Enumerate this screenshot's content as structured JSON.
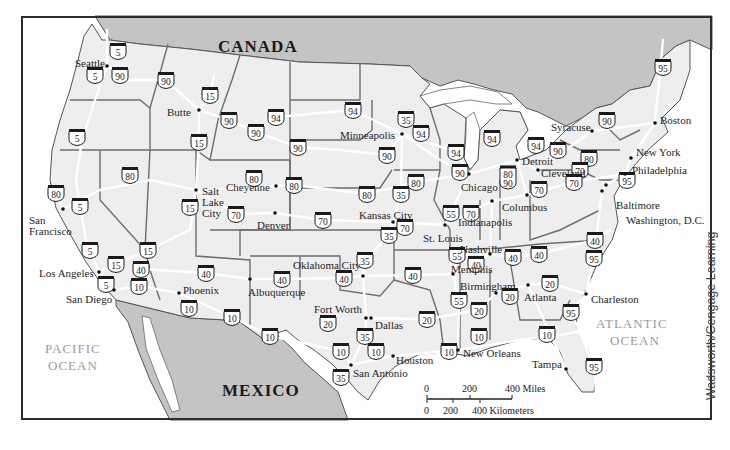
{
  "map": {
    "credit": "Wadsworth/Cengage Learning",
    "colors": {
      "land_us": "#eeeeee",
      "land_foreign": "#c4c4c4",
      "water": "#ffffff",
      "roads": "#ffffff",
      "state_borders": "#6e6e6e",
      "country_border": "#4a4a4a",
      "frame": "#2b2b2b"
    },
    "countries": [
      {
        "name": "CANADA",
        "x": 218,
        "y": 52
      },
      {
        "name": "MEXICO",
        "x": 222,
        "y": 396
      }
    ],
    "oceans": [
      {
        "name": "PACIFIC",
        "line2": "OCEAN",
        "x": 78,
        "y": 350
      },
      {
        "name": "ATLANTIC",
        "line2": "OCEAN",
        "x": 644,
        "y": 330
      }
    ],
    "cities": [
      {
        "name": "Seattle",
        "x": 107,
        "y": 66,
        "dx": -32,
        "dy": -2
      },
      {
        "name": "Butte",
        "x": 199,
        "y": 110,
        "dx": -32,
        "dy": 3
      },
      {
        "name": "Minneapolis",
        "x": 402,
        "y": 134,
        "dx": -62,
        "dy": 2
      },
      {
        "name": "Syracuse",
        "x": 592,
        "y": 131,
        "dx": -41,
        "dy": -3
      },
      {
        "name": "Boston",
        "x": 655,
        "y": 123,
        "dx": 5,
        "dy": -2
      },
      {
        "name": "Detroit",
        "x": 517,
        "y": 160,
        "dx": 5,
        "dy": 2
      },
      {
        "name": "New York",
        "x": 631,
        "y": 158,
        "dx": 5,
        "dy": -5
      },
      {
        "name": "Philadelphia",
        "x": 625,
        "y": 174,
        "dx": 7,
        "dy": -3
      },
      {
        "name": "Cleveland",
        "x": 538,
        "y": 170,
        "dx": 3,
        "dy": 4
      },
      {
        "name": "Chicago",
        "x": 469,
        "y": 174,
        "dx": -8,
        "dy": 14
      },
      {
        "name": "Baltimore",
        "x": 606,
        "y": 185,
        "dx": 10,
        "dy": 21
      },
      {
        "name": "Washington, D.C.",
        "x": 602,
        "y": 191,
        "dx": 24,
        "dy": 30
      },
      {
        "name": "Columbus",
        "x": 527,
        "y": 195,
        "dx": -25,
        "dy": 13
      },
      {
        "name": "Indianapolis",
        "x": 492,
        "y": 201,
        "dx": -34,
        "dy": 22
      },
      {
        "name": "Salt Lake City",
        "x": 196,
        "y": 190,
        "dx": 6,
        "dy": 2
      },
      {
        "name": "Cheyenne",
        "x": 276,
        "y": 186,
        "dx": -50,
        "dy": 2
      },
      {
        "name": "Denver",
        "x": 275,
        "y": 213,
        "dx": -18,
        "dy": 13
      },
      {
        "name": "Kansas City",
        "x": 393,
        "y": 222,
        "dx": -34,
        "dy": -6
      },
      {
        "name": "St. Louis",
        "x": 445,
        "y": 225,
        "dx": -22,
        "dy": 14
      },
      {
        "name": "Nashville",
        "x": 490,
        "y": 254,
        "dx": -30,
        "dy": -4
      },
      {
        "name": "San Francisco",
        "x": 63,
        "y": 209,
        "dx": -34,
        "dy": 12
      },
      {
        "name": "Los Angeles",
        "x": 99,
        "y": 272,
        "dx": -60,
        "dy": 2
      },
      {
        "name": "San Diego",
        "x": 114,
        "y": 290,
        "dx": -48,
        "dy": 10
      },
      {
        "name": "Phoenix",
        "x": 179,
        "y": 293,
        "dx": 4,
        "dy": -2
      },
      {
        "name": "Albuquerque",
        "x": 250,
        "y": 279,
        "dx": -2,
        "dy": 14
      },
      {
        "name": "Oklahoma City",
        "x": 363,
        "y": 276,
        "dx": -70,
        "dy": -10
      },
      {
        "name": "Memphis",
        "x": 453,
        "y": 274,
        "dx": -2,
        "dy": -4
      },
      {
        "name": "Birmingham",
        "x": 496,
        "y": 293,
        "dx": -36,
        "dy": -6
      },
      {
        "name": "Atlanta",
        "x": 528,
        "y": 285,
        "dx": -4,
        "dy": 13
      },
      {
        "name": "Charleston",
        "x": 586,
        "y": 294,
        "dx": 5,
        "dy": 6
      },
      {
        "name": "Fort Worth",
        "x": 366,
        "y": 318,
        "dx": -52,
        "dy": -8
      },
      {
        "name": "Dallas",
        "x": 371,
        "y": 318,
        "dx": 4,
        "dy": 8
      },
      {
        "name": "Houston",
        "x": 393,
        "y": 356,
        "dx": 3,
        "dy": 5
      },
      {
        "name": "San Antonio",
        "x": 351,
        "y": 365,
        "dx": 2,
        "dy": 9
      },
      {
        "name": "New Orleans",
        "x": 458,
        "y": 350,
        "dx": 5,
        "dy": 4
      },
      {
        "name": "Tampa",
        "x": 566,
        "y": 369,
        "dx": -34,
        "dy": -4
      }
    ],
    "interstates": [
      {
        "num": "5",
        "x": 118,
        "y": 51
      },
      {
        "num": "5",
        "x": 95,
        "y": 75
      },
      {
        "num": "90",
        "x": 120,
        "y": 75
      },
      {
        "num": "90",
        "x": 166,
        "y": 80
      },
      {
        "num": "15",
        "x": 210,
        "y": 95
      },
      {
        "num": "90",
        "x": 229,
        "y": 120
      },
      {
        "num": "15",
        "x": 199,
        "y": 142
      },
      {
        "num": "94",
        "x": 276,
        "y": 117
      },
      {
        "num": "90",
        "x": 256,
        "y": 132
      },
      {
        "num": "94",
        "x": 353,
        "y": 110
      },
      {
        "num": "35",
        "x": 406,
        "y": 119
      },
      {
        "num": "94",
        "x": 421,
        "y": 133
      },
      {
        "num": "90",
        "x": 298,
        "y": 147
      },
      {
        "num": "90",
        "x": 387,
        "y": 155
      },
      {
        "num": "94",
        "x": 456,
        "y": 152
      },
      {
        "num": "94",
        "x": 492,
        "y": 138
      },
      {
        "num": "94",
        "x": 536,
        "y": 145
      },
      {
        "num": "90",
        "x": 558,
        "y": 150
      },
      {
        "num": "90",
        "x": 607,
        "y": 120
      },
      {
        "num": "95",
        "x": 663,
        "y": 67
      },
      {
        "num": "80",
        "x": 589,
        "y": 158
      },
      {
        "num": "70",
        "x": 580,
        "y": 170
      },
      {
        "num": "70",
        "x": 574,
        "y": 182
      },
      {
        "num": "95",
        "x": 627,
        "y": 180
      },
      {
        "num": "90",
        "x": 460,
        "y": 172
      },
      {
        "num": "80/90",
        "x": 508,
        "y": 177
      },
      {
        "num": "70",
        "x": 539,
        "y": 189
      },
      {
        "num": "5",
        "x": 77,
        "y": 137
      },
      {
        "num": "80",
        "x": 130,
        "y": 175
      },
      {
        "num": "80",
        "x": 56,
        "y": 193
      },
      {
        "num": "5",
        "x": 80,
        "y": 206
      },
      {
        "num": "15",
        "x": 190,
        "y": 207
      },
      {
        "num": "70",
        "x": 236,
        "y": 214
      },
      {
        "num": "80",
        "x": 254,
        "y": 178
      },
      {
        "num": "80",
        "x": 294,
        "y": 185
      },
      {
        "num": "80",
        "x": 367,
        "y": 194
      },
      {
        "num": "80",
        "x": 416,
        "y": 182
      },
      {
        "num": "35",
        "x": 401,
        "y": 194
      },
      {
        "num": "70",
        "x": 323,
        "y": 220
      },
      {
        "num": "70",
        "x": 405,
        "y": 227
      },
      {
        "num": "35",
        "x": 389,
        "y": 235
      },
      {
        "num": "55",
        "x": 451,
        "y": 213
      },
      {
        "num": "70",
        "x": 471,
        "y": 213
      },
      {
        "num": "5",
        "x": 90,
        "y": 250
      },
      {
        "num": "15",
        "x": 148,
        "y": 250
      },
      {
        "num": "15",
        "x": 116,
        "y": 264
      },
      {
        "num": "40",
        "x": 141,
        "y": 269
      },
      {
        "num": "5",
        "x": 106,
        "y": 284
      },
      {
        "num": "10",
        "x": 139,
        "y": 286
      },
      {
        "num": "40",
        "x": 206,
        "y": 273
      },
      {
        "num": "10",
        "x": 189,
        "y": 308
      },
      {
        "num": "10",
        "x": 232,
        "y": 317
      },
      {
        "num": "40",
        "x": 282,
        "y": 279
      },
      {
        "num": "10",
        "x": 270,
        "y": 336
      },
      {
        "num": "35",
        "x": 365,
        "y": 260
      },
      {
        "num": "40",
        "x": 344,
        "y": 278
      },
      {
        "num": "40",
        "x": 413,
        "y": 275
      },
      {
        "num": "55",
        "x": 457,
        "y": 255
      },
      {
        "num": "40",
        "x": 476,
        "y": 264
      },
      {
        "num": "40",
        "x": 513,
        "y": 257
      },
      {
        "num": "40",
        "x": 539,
        "y": 254
      },
      {
        "num": "40",
        "x": 595,
        "y": 240
      },
      {
        "num": "95",
        "x": 594,
        "y": 258
      },
      {
        "num": "55",
        "x": 459,
        "y": 300
      },
      {
        "num": "20",
        "x": 510,
        "y": 296
      },
      {
        "num": "20",
        "x": 550,
        "y": 283
      },
      {
        "num": "20",
        "x": 427,
        "y": 319
      },
      {
        "num": "20",
        "x": 479,
        "y": 310
      },
      {
        "num": "95",
        "x": 571,
        "y": 312
      },
      {
        "num": "10",
        "x": 479,
        "y": 336
      },
      {
        "num": "10",
        "x": 547,
        "y": 334
      },
      {
        "num": "20",
        "x": 328,
        "y": 323
      },
      {
        "num": "35",
        "x": 365,
        "y": 336
      },
      {
        "num": "10",
        "x": 341,
        "y": 351
      },
      {
        "num": "10",
        "x": 376,
        "y": 351
      },
      {
        "num": "10",
        "x": 449,
        "y": 351
      },
      {
        "num": "35",
        "x": 341,
        "y": 377
      },
      {
        "num": "95",
        "x": 594,
        "y": 366
      }
    ],
    "scale": {
      "miles_ticks": [
        "0",
        "200",
        "400 Miles"
      ],
      "km_ticks": [
        "0",
        "200",
        "400 Kilometers"
      ]
    }
  }
}
